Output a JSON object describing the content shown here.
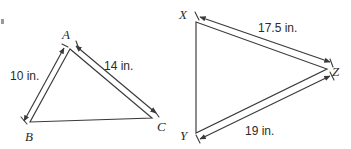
{
  "figure": {
    "kind": "geometry-diagram",
    "stroke_color": "#3a3a3a",
    "text_color": "#2b2b2b",
    "background_color": "#ffffff"
  },
  "triangles": [
    {
      "id": "triangle-abc",
      "name": "Triangle ABC",
      "vertices": [
        {
          "label": "A",
          "x": 70,
          "y": 49
        },
        {
          "label": "B",
          "x": 30,
          "y": 122
        },
        {
          "label": "C",
          "x": 152,
          "y": 118
        }
      ],
      "vertex_label_positions": [
        {
          "label": "A",
          "x": 62,
          "y": 39
        },
        {
          "label": "B",
          "x": 25,
          "y": 141
        },
        {
          "label": "C",
          "x": 157,
          "y": 131
        }
      ],
      "measures": [
        {
          "side": "AB",
          "value": "10 in.",
          "x": 10,
          "y": 80
        },
        {
          "side": "AC",
          "value": "14 in.",
          "x": 104,
          "y": 70
        }
      ]
    },
    {
      "id": "triangle-xyz",
      "name": "Triangle XYZ",
      "vertices": [
        {
          "label": "X",
          "x": 196,
          "y": 22
        },
        {
          "label": "Y",
          "x": 196,
          "y": 133
        },
        {
          "label": "Z",
          "x": 327,
          "y": 69
        }
      ],
      "vertex_label_positions": [
        {
          "label": "X",
          "x": 179,
          "y": 19
        },
        {
          "label": "Y",
          "x": 180,
          "y": 140
        },
        {
          "label": "Z",
          "x": 332,
          "y": 76
        }
      ],
      "measures": [
        {
          "side": "XZ",
          "value": "17.5 in.",
          "x": 258,
          "y": 32
        },
        {
          "side": "YZ",
          "value": "19 in.",
          "x": 245,
          "y": 135
        }
      ]
    }
  ]
}
